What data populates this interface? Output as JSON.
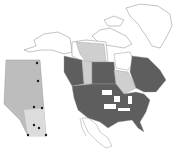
{
  "map": {
    "subject": "North America with Alberta inset",
    "colors": {
      "background": "#ffffff",
      "outline": "#9a9a9a",
      "present": "#5e5e5e",
      "partial": "#cfcfcf",
      "absent": "#ffffff",
      "inset_fill": "#bdbdbd",
      "inset_light": "#dcdcdc",
      "site_marker": "#1a1a1a"
    },
    "legend": [],
    "inset": {
      "region": "Alberta",
      "sites": [
        {
          "x": 37,
          "y": 63
        },
        {
          "x": 38,
          "y": 81
        },
        {
          "x": 34,
          "y": 107
        },
        {
          "x": 42,
          "y": 108
        },
        {
          "x": 34,
          "y": 125
        },
        {
          "x": 39,
          "y": 128
        },
        {
          "x": 28,
          "y": 135
        },
        {
          "x": 46,
          "y": 135
        }
      ]
    }
  }
}
